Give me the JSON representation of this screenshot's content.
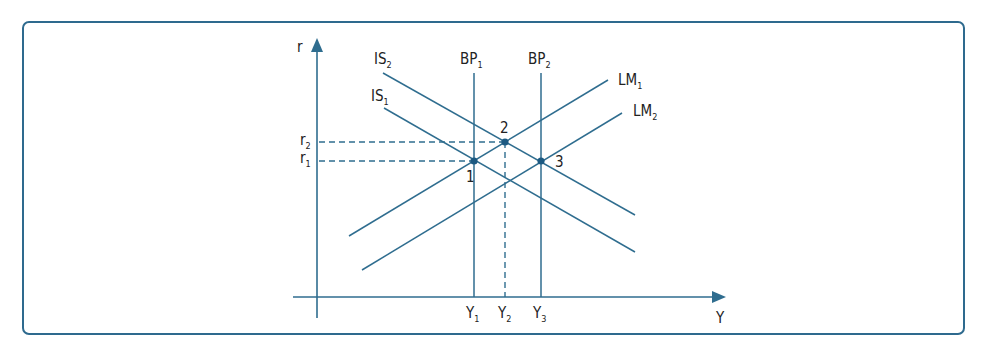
{
  "diagram": {
    "type": "IS-LM-BP",
    "colors": {
      "line": "#2f6d8f",
      "point": "#1d5a82",
      "frame": "#2e6a8e",
      "text": "#222222"
    },
    "axes": {
      "y_axis_label": "r",
      "x_axis_label": "Y",
      "y_ticks": [
        {
          "base": "r",
          "sub": "2"
        },
        {
          "base": "r",
          "sub": "1"
        }
      ],
      "x_ticks": [
        {
          "base": "Y",
          "sub": "1"
        },
        {
          "base": "Y",
          "sub": "2"
        },
        {
          "base": "Y",
          "sub": "3"
        }
      ]
    },
    "curves": {
      "IS2": {
        "base": "IS",
        "sub": "2"
      },
      "IS1": {
        "base": "IS",
        "sub": "1"
      },
      "BP1": {
        "base": "BP",
        "sub": "1"
      },
      "BP2": {
        "base": "BP",
        "sub": "2"
      },
      "LM1": {
        "base": "LM",
        "sub": "1"
      },
      "LM2": {
        "base": "LM",
        "sub": "2"
      }
    },
    "points": [
      {
        "label": "1",
        "at": "IS1 ∩ LM1 ∩ BP1",
        "r": "r1",
        "Y": "Y1"
      },
      {
        "label": "2",
        "at": "IS2 ∩ LM1",
        "r": "r2",
        "Y": "Y2"
      },
      {
        "label": "3",
        "at": "IS2 ∩ LM2 ∩ BP2",
        "r": "r1",
        "Y": "Y3"
      }
    ]
  }
}
